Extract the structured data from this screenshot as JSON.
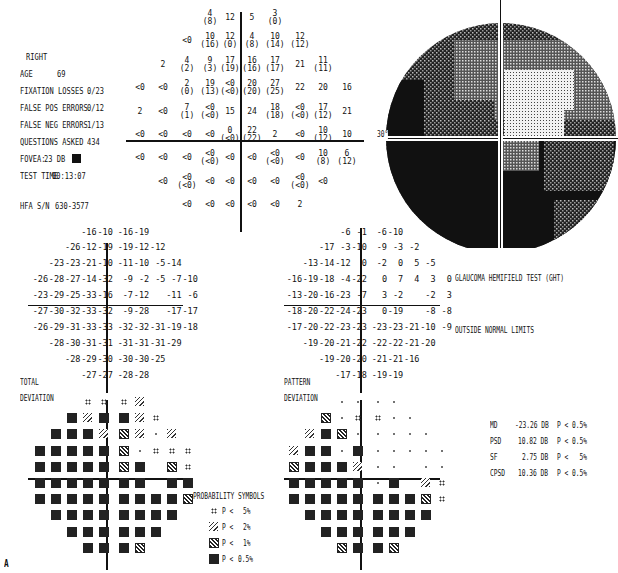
{
  "header": {
    "eye": "RIGHT",
    "age_label": "AGE",
    "age_value": "69",
    "fixation_label": "FIXATION LOSSES",
    "fixation_value": "0/23",
    "false_pos_label": "FALSE POS ERRORS",
    "false_pos_value": "0/12",
    "false_neg_label": "FALSE NEG ERRORS",
    "false_neg_value": "1/13",
    "questions_label": "QUESTIONS ASKED",
    "questions_value": "434",
    "fovea_label": "FOVEA:",
    "fovea_value": "23 DB",
    "test_time_label": "TEST TIME",
    "test_time_value": "00:13:07",
    "hfa_label": "HFA S/N",
    "hfa_value": "630-3577"
  },
  "threshold_map": {
    "rows": [
      [
        null,
        null,
        null,
        [
          "4",
          "(8)"
        ],
        [
          "12",
          ""
        ],
        [
          "5",
          ""
        ],
        [
          "3",
          "(0)"
        ],
        null,
        null,
        null
      ],
      [
        null,
        null,
        [
          "<0",
          ""
        ],
        [
          "10",
          "(16)"
        ],
        [
          "12",
          "(0)"
        ],
        [
          "4",
          "(8)"
        ],
        [
          "10",
          "(14)"
        ],
        [
          "12",
          "(12)"
        ],
        null,
        null
      ],
      [
        null,
        [
          "2",
          ""
        ],
        [
          "4",
          "(2)"
        ],
        [
          "9",
          "(3)"
        ],
        [
          "17",
          "(19)"
        ],
        [
          "16",
          "(16)"
        ],
        [
          "17",
          "(17)"
        ],
        [
          "21",
          ""
        ],
        [
          "11",
          "(11)"
        ],
        null
      ],
      [
        [
          "<0",
          ""
        ],
        [
          "<0",
          ""
        ],
        [
          "2",
          "(0)"
        ],
        [
          "19",
          "(13)"
        ],
        [
          "<0",
          "(<0)"
        ],
        [
          "20",
          "(20)"
        ],
        [
          "27",
          "(25)"
        ],
        [
          "22",
          ""
        ],
        [
          "20",
          ""
        ],
        [
          "16",
          ""
        ]
      ],
      [
        [
          "2",
          ""
        ],
        [
          "<0",
          ""
        ],
        [
          "7",
          "(1)"
        ],
        [
          "<0",
          "(<0)"
        ],
        [
          "15",
          ""
        ],
        [
          "24",
          ""
        ],
        [
          "18",
          "(18)"
        ],
        [
          "<0",
          "(<0)"
        ],
        [
          "17",
          "(12)"
        ],
        [
          "21",
          ""
        ]
      ],
      [
        [
          "<0",
          ""
        ],
        [
          "<0",
          ""
        ],
        [
          "<0",
          ""
        ],
        [
          "<0",
          ""
        ],
        [
          "0",
          "(<0)"
        ],
        [
          "22",
          "(22)"
        ],
        [
          "2",
          ""
        ],
        [
          "<0",
          ""
        ],
        [
          "10",
          "(12)"
        ],
        [
          "10",
          ""
        ]
      ],
      [
        [
          "<0",
          ""
        ],
        [
          "<0",
          ""
        ],
        [
          "<0",
          ""
        ],
        [
          "<0",
          "(<0)"
        ],
        [
          "<0",
          ""
        ],
        [
          "<0",
          ""
        ],
        [
          "<0",
          "(<0)"
        ],
        [
          "<0",
          ""
        ],
        [
          "10",
          "(8)"
        ],
        [
          "6",
          "(12)"
        ]
      ],
      [
        null,
        [
          "<0",
          ""
        ],
        [
          "<0",
          "(<0)"
        ],
        [
          "<0",
          ""
        ],
        [
          "<0",
          ""
        ],
        [
          "<0",
          ""
        ],
        [
          "<0",
          ""
        ],
        [
          "<0",
          "(<0)"
        ],
        [
          "<0",
          ""
        ],
        null
      ],
      [
        null,
        null,
        [
          "<0",
          ""
        ],
        [
          "<0",
          ""
        ],
        [
          "<0",
          ""
        ],
        [
          "<0",
          ""
        ],
        [
          "<0",
          ""
        ],
        [
          "2",
          ""
        ],
        null,
        null
      ]
    ]
  },
  "grayscale": {
    "axis_label": "30°"
  },
  "total_deviation": {
    "title_1": "TOTAL",
    "title_2": "DEVIATION",
    "rows": [
      [
        null,
        null,
        null,
        "-16",
        "-10",
        "-16",
        "-19",
        null,
        null,
        null
      ],
      [
        null,
        null,
        "-26",
        "-12",
        "-19",
        "-19",
        "-12",
        "-12",
        null,
        null
      ],
      [
        null,
        "-23",
        "-23",
        "-21",
        "-10",
        "-11",
        "-10",
        "-5",
        "-14",
        null
      ],
      [
        "-26",
        "-28",
        "-27",
        "-14",
        "-32",
        "-9",
        "-2",
        "-5",
        "-7",
        "-10"
      ],
      [
        "-23",
        "-29",
        "-25",
        "-33",
        "-16",
        "-7",
        "-12",
        null,
        "-11",
        "-6"
      ],
      [
        "-27",
        "-30",
        "-32",
        "-33",
        "-32",
        "-9",
        "-28",
        null,
        "-17",
        "-17"
      ],
      [
        "-26",
        "-29",
        "-31",
        "-33",
        "-33",
        "-32",
        "-32",
        "-31",
        "-19",
        "-18"
      ],
      [
        null,
        "-28",
        "-30",
        "-31",
        "-31",
        "-31",
        "-31",
        "-31",
        "-29",
        null
      ],
      [
        null,
        null,
        "-28",
        "-29",
        "-30",
        "-30",
        "-30",
        "-25",
        null,
        null
      ],
      [
        null,
        null,
        null,
        "-27",
        "-27",
        "-28",
        "-28",
        null,
        null,
        null
      ]
    ]
  },
  "pattern_deviation": {
    "title_1": "PATTERN",
    "title_2": "DEVIATION",
    "rows": [
      [
        null,
        null,
        null,
        "-6",
        "-1",
        "-6",
        "-10",
        null,
        null,
        null
      ],
      [
        null,
        null,
        "-17",
        "-3",
        "-10",
        "-9",
        "-3",
        "-2",
        null,
        null
      ],
      [
        null,
        "-13",
        "-14",
        "-12",
        "0",
        "-2",
        "0",
        "5",
        "-5",
        null
      ],
      [
        "-16",
        "-19",
        "-18",
        "-4",
        "-22",
        "0",
        "7",
        "4",
        "3",
        "0"
      ],
      [
        "-13",
        "-20",
        "-16",
        "-23",
        "-7",
        "3",
        "-2",
        null,
        "-2",
        "3"
      ],
      [
        "-18",
        "-20",
        "-22",
        "-24",
        "-23",
        "0",
        "-19",
        null,
        "-8",
        "-8"
      ],
      [
        "-17",
        "-20",
        "-22",
        "-23",
        "-23",
        "-23",
        "-23",
        "-21",
        "-10",
        "-9"
      ],
      [
        null,
        "-19",
        "-20",
        "-21",
        "-22",
        "-22",
        "-22",
        "-21",
        "-20",
        null
      ],
      [
        null,
        null,
        "-19",
        "-20",
        "-20",
        "-21",
        "-21",
        "-16",
        null,
        null
      ],
      [
        null,
        null,
        null,
        "-17",
        "-18",
        "-19",
        "-19",
        null,
        null,
        null
      ]
    ]
  },
  "td_prob": {
    "rows": [
      [
        null,
        null,
        null,
        1,
        1,
        1,
        2,
        null,
        null,
        null
      ],
      [
        null,
        null,
        4,
        2,
        4,
        4,
        2,
        1,
        null,
        null
      ],
      [
        null,
        4,
        4,
        4,
        2,
        3,
        2,
        0,
        2,
        null
      ],
      [
        4,
        4,
        4,
        4,
        4,
        3,
        0,
        1,
        1,
        1
      ],
      [
        4,
        4,
        4,
        4,
        4,
        3,
        4,
        null,
        3,
        1
      ],
      [
        4,
        4,
        4,
        4,
        4,
        4,
        4,
        null,
        4,
        4
      ],
      [
        4,
        4,
        4,
        4,
        4,
        4,
        4,
        4,
        4,
        3
      ],
      [
        null,
        4,
        4,
        4,
        4,
        4,
        4,
        4,
        4,
        null
      ],
      [
        null,
        null,
        4,
        4,
        4,
        4,
        4,
        4,
        null,
        null
      ],
      [
        null,
        null,
        null,
        4,
        4,
        4,
        3,
        null,
        null,
        null
      ]
    ]
  },
  "pd_prob": {
    "rows": [
      [
        null,
        null,
        null,
        0,
        0,
        0,
        0,
        null,
        null,
        null
      ],
      [
        null,
        null,
        3,
        0,
        1,
        1,
        0,
        0,
        null,
        null
      ],
      [
        null,
        2,
        4,
        3,
        0,
        0,
        0,
        0,
        0,
        null
      ],
      [
        2,
        4,
        4,
        0,
        4,
        0,
        0,
        0,
        0,
        0
      ],
      [
        3,
        4,
        4,
        4,
        2,
        0,
        0,
        null,
        0,
        0
      ],
      [
        4,
        4,
        4,
        4,
        4,
        0,
        4,
        null,
        2,
        1
      ],
      [
        4,
        4,
        4,
        4,
        4,
        4,
        4,
        4,
        3,
        1
      ],
      [
        null,
        4,
        4,
        4,
        4,
        4,
        4,
        4,
        4,
        null
      ],
      [
        null,
        null,
        4,
        4,
        4,
        4,
        4,
        4,
        null,
        null
      ],
      [
        null,
        null,
        null,
        3,
        4,
        4,
        3,
        null,
        null,
        null
      ]
    ]
  },
  "legend": {
    "title": "PROBABILITY SYMBOLS",
    "items": [
      {
        "p": "P <",
        "v": "5%"
      },
      {
        "p": "P <",
        "v": "2%"
      },
      {
        "p": "P <",
        "v": "1%"
      },
      {
        "p": "P <",
        "v": "0.5%"
      }
    ]
  },
  "ght": {
    "title": "GLAUCOMA HEMIFIELD TEST (GHT)",
    "result": "OUTSIDE NORMAL LIMITS"
  },
  "indices": [
    {
      "name": "MD",
      "value": "-23.26 DB",
      "p": "P < 0.5%"
    },
    {
      "name": "PSD",
      "value": "10.82 DB",
      "p": "P < 0.5%"
    },
    {
      "name": "SF",
      "value": "2.75 DB",
      "p": "P <   5%"
    },
    {
      "name": "CPSD",
      "value": "10.36 DB",
      "p": "P < 0.5%"
    }
  ],
  "figure_label": "A"
}
